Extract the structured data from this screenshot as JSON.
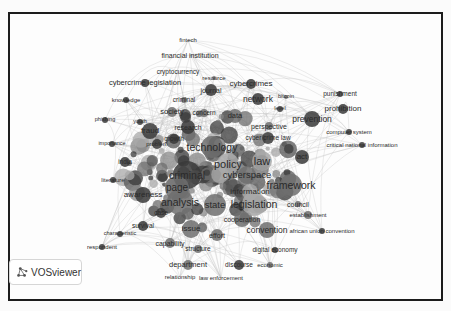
{
  "app": {
    "brand": "VOSviewer",
    "brand_icon": "vosviewer-logo-icon"
  },
  "colors": {
    "frame": "#1c1c1c",
    "edge": "#b8b8b8",
    "node_dark": "#3a3a3a",
    "node_mid": "#6e6e6e",
    "node_light": "#a8a8a8",
    "label": "#2a2a2a"
  },
  "network": {
    "type": "co-occurrence keyword map",
    "nodes": [
      {
        "label": "fintech",
        "x": 186,
        "y": 38,
        "r": 0,
        "size": 6,
        "shade": "light"
      },
      {
        "label": "financial institution",
        "x": 188,
        "y": 53,
        "r": 0,
        "size": 7,
        "shade": "light"
      },
      {
        "label": "cryptocurrency",
        "x": 176,
        "y": 70,
        "r": 0,
        "size": 6.5,
        "shade": "light"
      },
      {
        "label": "resource",
        "x": 212,
        "y": 76,
        "r": 2,
        "size": 6,
        "shade": "mid"
      },
      {
        "label": "cybercrime legislation",
        "x": 143,
        "y": 81,
        "r": 4,
        "size": 7.5,
        "shade": "dark"
      },
      {
        "label": "journal",
        "x": 209,
        "y": 88,
        "r": 6,
        "size": 7,
        "shade": "dark"
      },
      {
        "label": "cybercrimes",
        "x": 249,
        "y": 82,
        "r": 5,
        "size": 8,
        "shade": "dark"
      },
      {
        "label": "knowledge",
        "x": 124,
        "y": 98,
        "r": 3,
        "size": 6,
        "shade": "dark"
      },
      {
        "label": "criminal",
        "x": 182,
        "y": 98,
        "r": 3,
        "size": 6.5,
        "shade": "mid"
      },
      {
        "label": "network",
        "x": 256,
        "y": 97,
        "r": 6,
        "size": 8.5,
        "shade": "dark"
      },
      {
        "label": "bitcoin",
        "x": 284,
        "y": 95,
        "r": 2,
        "size": 5.5,
        "shade": "mid"
      },
      {
        "label": "punishment",
        "x": 338,
        "y": 92,
        "r": 3,
        "size": 6.5,
        "shade": "dark"
      },
      {
        "label": "prohibition",
        "x": 341,
        "y": 107,
        "r": 5,
        "size": 8,
        "shade": "dark"
      },
      {
        "label": "society",
        "x": 170,
        "y": 110,
        "r": 5,
        "size": 7.5,
        "shade": "mid"
      },
      {
        "label": "concern",
        "x": 202,
        "y": 111,
        "r": 4,
        "size": 6.5,
        "shade": "mid"
      },
      {
        "label": "level",
        "x": 278,
        "y": 107,
        "r": 3,
        "size": 5.5,
        "shade": "dark"
      },
      {
        "label": "data",
        "x": 233,
        "y": 114,
        "r": 7,
        "size": 7.5,
        "shade": "mid"
      },
      {
        "label": "prevention",
        "x": 310,
        "y": 117,
        "r": 8,
        "size": 8.5,
        "shade": "dark"
      },
      {
        "label": "phishing",
        "x": 103,
        "y": 118,
        "r": 3,
        "size": 5.5,
        "shade": "dark"
      },
      {
        "label": "youth",
        "x": 138,
        "y": 120,
        "r": 3,
        "size": 5.5,
        "shade": "dark"
      },
      {
        "label": "research",
        "x": 186,
        "y": 125,
        "r": 7,
        "size": 7,
        "shade": "dark"
      },
      {
        "label": "perspective",
        "x": 267,
        "y": 124,
        "r": 4,
        "size": 7,
        "shade": "mid"
      },
      {
        "label": "fraud",
        "x": 148,
        "y": 129,
        "r": 8,
        "size": 8,
        "shade": "dark"
      },
      {
        "label": "computer system",
        "x": 347,
        "y": 130,
        "r": 3,
        "size": 6,
        "shade": "dark"
      },
      {
        "label": "cyber crime law",
        "x": 266,
        "y": 136,
        "r": 6,
        "size": 6.5,
        "shade": "dark"
      },
      {
        "label": "growth",
        "x": 172,
        "y": 137,
        "r": 5,
        "size": 6.5,
        "shade": "dark"
      },
      {
        "label": "importance",
        "x": 110,
        "y": 142,
        "r": 3,
        "size": 5.5,
        "shade": "dark"
      },
      {
        "label": "problem",
        "x": 155,
        "y": 142,
        "r": 5,
        "size": 6,
        "shade": "dark"
      },
      {
        "label": "technology",
        "x": 210,
        "y": 145,
        "r": 11,
        "size": 10.5,
        "shade": "mid"
      },
      {
        "label": "critical national information",
        "x": 360,
        "y": 143,
        "r": 3,
        "size": 6,
        "shade": "dark"
      },
      {
        "label": "act",
        "x": 300,
        "y": 155,
        "r": 7,
        "size": 8,
        "shade": "dark"
      },
      {
        "label": "law",
        "x": 260,
        "y": 159,
        "r": 10,
        "size": 11,
        "shade": "light"
      },
      {
        "label": "policy",
        "x": 226,
        "y": 162,
        "r": 11,
        "size": 11,
        "shade": "light"
      },
      {
        "label": "india",
        "x": 123,
        "y": 160,
        "r": 5,
        "size": 6.5,
        "shade": "dark"
      },
      {
        "label": "criminal",
        "x": 185,
        "y": 173,
        "r": 14,
        "size": 10.5,
        "shade": "dark"
      },
      {
        "label": "cyberspace",
        "x": 245,
        "y": 173,
        "r": 9,
        "size": 9.5,
        "shade": "mid"
      },
      {
        "label": "literature",
        "x": 111,
        "y": 178,
        "r": 3,
        "size": 6,
        "shade": "dark"
      },
      {
        "label": "framework",
        "x": 289,
        "y": 183,
        "r": 11,
        "size": 10.5,
        "shade": "mid"
      },
      {
        "label": "page",
        "x": 175,
        "y": 186,
        "r": 12,
        "size": 10,
        "shade": "mid"
      },
      {
        "label": "information",
        "x": 248,
        "y": 190,
        "r": 8,
        "size": 8,
        "shade": "light"
      },
      {
        "label": "awareness",
        "x": 141,
        "y": 193,
        "r": 8,
        "size": 8,
        "shade": "dark"
      },
      {
        "label": "analysis",
        "x": 178,
        "y": 200,
        "r": 13,
        "size": 10.5,
        "shade": "mid"
      },
      {
        "label": "state",
        "x": 213,
        "y": 203,
        "r": 11,
        "size": 9.5,
        "shade": "mid"
      },
      {
        "label": "legislation",
        "x": 252,
        "y": 202,
        "r": 12,
        "size": 10.5,
        "shade": "light"
      },
      {
        "label": "council",
        "x": 296,
        "y": 202,
        "r": 3,
        "size": 7,
        "shade": "mid"
      },
      {
        "label": "case",
        "x": 159,
        "y": 211,
        "r": 5,
        "size": 6.5,
        "shade": "dark"
      },
      {
        "label": "establishment",
        "x": 306,
        "y": 213,
        "r": 4,
        "size": 6,
        "shade": "mid"
      },
      {
        "label": "cooperation",
        "x": 240,
        "y": 217,
        "r": 8,
        "size": 7,
        "shade": "mid"
      },
      {
        "label": "survival",
        "x": 141,
        "y": 224,
        "r": 5,
        "size": 6.5,
        "shade": "dark"
      },
      {
        "label": "issue",
        "x": 189,
        "y": 227,
        "r": 9,
        "size": 8,
        "shade": "mid"
      },
      {
        "label": "convention",
        "x": 265,
        "y": 228,
        "r": 8,
        "size": 8.5,
        "shade": "mid"
      },
      {
        "label": "african union convention",
        "x": 320,
        "y": 229,
        "r": 3,
        "size": 6,
        "shade": "dark"
      },
      {
        "label": "effort",
        "x": 215,
        "y": 233,
        "r": 6,
        "size": 7,
        "shade": "mid"
      },
      {
        "label": "characteristic",
        "x": 118,
        "y": 232,
        "r": 3,
        "size": 5.5,
        "shade": "dark"
      },
      {
        "label": "capability",
        "x": 168,
        "y": 241,
        "r": 5,
        "size": 7,
        "shade": "mid"
      },
      {
        "label": "respondent",
        "x": 100,
        "y": 245,
        "r": 3,
        "size": 6,
        "shade": "dark"
      },
      {
        "label": "structure",
        "x": 196,
        "y": 247,
        "r": 4,
        "size": 6.5,
        "shade": "mid"
      },
      {
        "label": "digital economy",
        "x": 273,
        "y": 248,
        "r": 3,
        "size": 6.5,
        "shade": "dark"
      },
      {
        "label": "department",
        "x": 186,
        "y": 263,
        "r": 5,
        "size": 7.5,
        "shade": "mid"
      },
      {
        "label": "discourse",
        "x": 237,
        "y": 263,
        "r": 5,
        "size": 6.5,
        "shade": "dark"
      },
      {
        "label": "economic",
        "x": 268,
        "y": 263,
        "r": 3,
        "size": 6,
        "shade": "mid"
      },
      {
        "label": "relationship",
        "x": 178,
        "y": 275,
        "r": 0,
        "size": 6,
        "shade": "light"
      },
      {
        "label": "law enforcement",
        "x": 219,
        "y": 276,
        "r": 0,
        "size": 6,
        "shade": "light"
      }
    ]
  }
}
